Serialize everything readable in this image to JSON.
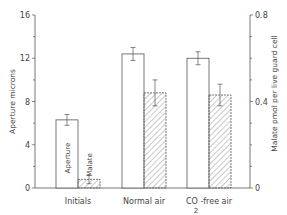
{
  "chart_data": {
    "type": "bar",
    "title": "",
    "categories": [
      "Initials",
      "Normal air",
      "CO2-free air"
    ],
    "category_labels": [
      {
        "main": "Initials",
        "sub": ""
      },
      {
        "main": "Normal air",
        "sub": ""
      },
      {
        "main": "CO  -free air",
        "sub": "2"
      }
    ],
    "series": [
      {
        "name": "Aperture",
        "axis": "left",
        "fill": "white",
        "values": [
          6.3,
          12.4,
          12.0
        ],
        "errors": [
          0.5,
          0.6,
          0.6
        ]
      },
      {
        "name": "Malate",
        "axis": "right",
        "fill": "hatched",
        "values": [
          0.04,
          0.44,
          0.43
        ],
        "errors": [
          0.02,
          0.06,
          0.05
        ]
      }
    ],
    "bar_annotations": [
      "Aperture",
      "Malate"
    ],
    "ylabel": "Aperture microns",
    "ylabel_right": "Malate pmol per live guard cell",
    "ylim": [
      0,
      16
    ],
    "ylim_right": [
      0,
      0.8
    ],
    "yticks": [
      "0",
      "4",
      "8",
      "12",
      "16"
    ],
    "yticks_right": [
      "0",
      "0.4",
      "0.8"
    ],
    "grid": false,
    "legend": "none (bars labelled inline in first group)"
  }
}
